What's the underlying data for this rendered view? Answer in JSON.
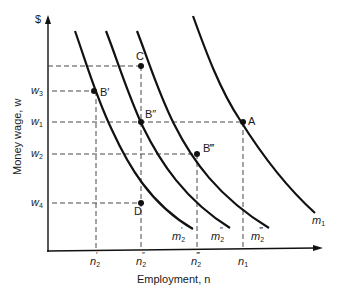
{
  "diagram": {
    "y_axis": {
      "unit_label": "$",
      "title": "Money wage, w"
    },
    "x_axis": {
      "title": "Employment, n"
    },
    "y_ticks": [
      {
        "id": "w3",
        "base": "w",
        "sub": "3",
        "y": 91
      },
      {
        "id": "w1",
        "base": "w",
        "sub": "1",
        "y": 122
      },
      {
        "id": "w2",
        "base": "w",
        "sub": "2",
        "y": 154
      },
      {
        "id": "w4",
        "base": "w",
        "sub": "4",
        "y": 203
      }
    ],
    "x_ticks": [
      {
        "id": "n2p",
        "base": "n",
        "sub": "2",
        "prime": "′",
        "x": 96
      },
      {
        "id": "n2pp",
        "base": "n",
        "sub": "2",
        "prime": "″",
        "x": 141
      },
      {
        "id": "n2ppp",
        "base": "n",
        "sub": "2",
        "prime": "‴",
        "x": 198
      },
      {
        "id": "n1",
        "base": "n",
        "sub": "1",
        "prime": "",
        "x": 243
      }
    ],
    "curves": [
      {
        "id": "m2p",
        "base": "m",
        "sub": "2",
        "prime": "′",
        "label_x": 172,
        "label_y": 240
      },
      {
        "id": "m2pp",
        "base": "m",
        "sub": "2",
        "prime": "″",
        "label_x": 211,
        "label_y": 240
      },
      {
        "id": "m2ppp",
        "base": "m",
        "sub": "2",
        "prime": "‴",
        "label_x": 251,
        "label_y": 240
      },
      {
        "id": "m1",
        "base": "m",
        "sub": "1",
        "prime": "",
        "label_x": 312,
        "label_y": 224
      }
    ],
    "points": [
      {
        "id": "A",
        "label": "A",
        "x": 243,
        "y": 122
      },
      {
        "id": "B1",
        "label": "B′",
        "x": 94,
        "y": 91
      },
      {
        "id": "B2",
        "label": "B″",
        "x": 141,
        "y": 122
      },
      {
        "id": "B3",
        "label": "B‴",
        "x": 197,
        "y": 154
      },
      {
        "id": "C",
        "label": "C",
        "x": 141,
        "y": 66
      },
      {
        "id": "D",
        "label": "D",
        "x": 141,
        "y": 203
      }
    ]
  }
}
